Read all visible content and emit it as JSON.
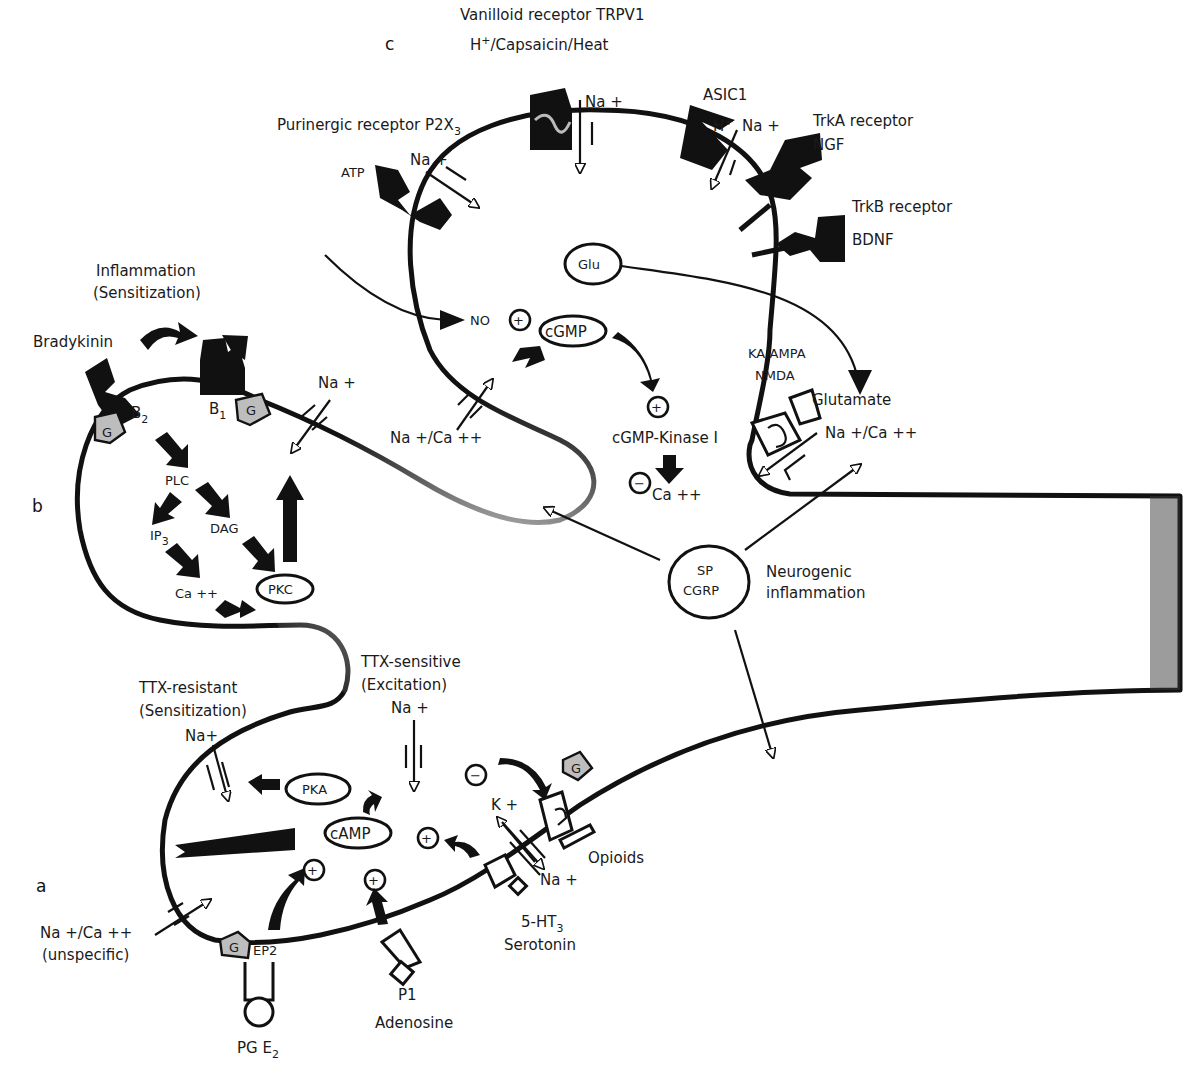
{
  "panels": {
    "a": "a",
    "b": "b",
    "c": "c"
  },
  "colors": {
    "membrane": "#111111",
    "fill_light": "#f2f2f2",
    "fill_mid": "#b8b8b8",
    "fill_dark": "#3a3a3a",
    "background": "#ffffff"
  },
  "panel_c": {
    "trpv1_title": "Vanilloid receptor TRPV1",
    "trpv1_ligand_main": "H",
    "trpv1_ligand_sup": "+",
    "trpv1_ligand_rest": "/Capsaicin/Heat",
    "trpv1_ion": "Na +",
    "p2x3_title": "Purinergic receptor P2X",
    "p2x3_sub": "3",
    "p2x3_ligand": "ATP",
    "p2x3_ion": "Na +",
    "asic1_title": "ASIC1",
    "asic1_ligand_main": "H",
    "asic1_ligand_sup": "+",
    "asic1_ion": "Na +",
    "trka_title": "TrkA receptor",
    "trka_ligand": "NGF",
    "trkb_title": "TrkB receptor",
    "trkb_ligand": "BDNF",
    "glu": "Glu",
    "no": "NO",
    "cgmp": "cGMP",
    "cgmp_kinase": "cGMP-Kinase I",
    "ca": "Ca ++",
    "channel_ion": "Na +/Ca ++",
    "glutamate_receptor": "KA/AMPA",
    "glutamate_receptor_2": "NMDA",
    "glutamate": "Glutamate",
    "glutamate_ion": "Na +/Ca ++",
    "plus": "+",
    "minus": "−"
  },
  "panel_b": {
    "inflammation": "Inflammation",
    "sensitization": "(Sensitization)",
    "bradykinin": "Bradykinin",
    "b2_main": "B",
    "b2_sub": "2",
    "b1_main": "B",
    "b1_sub": "1",
    "g": "G",
    "ion": "Na +",
    "plc": "PLC",
    "ip3_main": "IP",
    "ip3_sub": "3",
    "dag": "DAG",
    "ca": "Ca ++",
    "pkc": "PKC"
  },
  "center": {
    "sp": "SP",
    "cgrp": "CGRP",
    "neurogenic": "Neurogenic",
    "inflammation": "inflammation"
  },
  "panel_a": {
    "ttx_resistant": "TTX-resistant",
    "ttx_resistant_note": "(Sensitization)",
    "ttx_resistant_ion": "Na+",
    "ttx_sensitive": "TTX-sensitive",
    "ttx_sensitive_note": "(Excitation)",
    "ttx_sensitive_ion": "Na +",
    "pka": "PKA",
    "camp": "cAMP",
    "k_ion": "K +",
    "na_ion": "Na +",
    "opioids": "Opioids",
    "ht3_main": "5-HT",
    "ht3_sub": "3",
    "serotonin": "Serotonin",
    "unspecific_ion": "Na +/Ca ++",
    "unspecific": "(unspecific)",
    "g": "G",
    "ep2": "EP2",
    "pge2_main": "PG E",
    "pge2_sub": "2",
    "p1": "P1",
    "adenosine": "Adenosine",
    "plus": "+",
    "minus": "−"
  }
}
